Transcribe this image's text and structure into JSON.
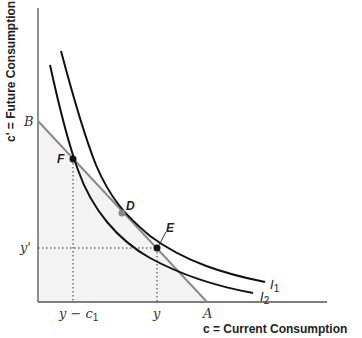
{
  "diagram": {
    "y_axis_title": "c' = Future Consumption",
    "x_axis_title": "c = Current Consumption",
    "axis_points": {
      "B": "B",
      "A": "A",
      "y_prime": "y'",
      "y": "y",
      "y_minus_c1": "y − c",
      "y_minus_c1_sub": "1"
    },
    "points": {
      "F": "F",
      "D": "D",
      "E": "E"
    },
    "curves": {
      "I1": "I",
      "I1_sub": "1",
      "I2": "I",
      "I2_sub": "2"
    },
    "colors": {
      "axis": "#444444",
      "curve": "#111111",
      "budget_line": "#888888",
      "shade": "#f2f2f2",
      "point_D": "#888888",
      "point_dark": "#111111"
    }
  }
}
